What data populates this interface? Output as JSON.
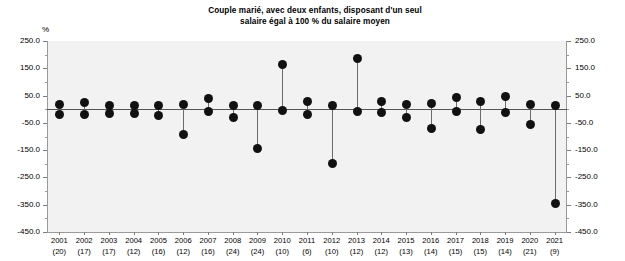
{
  "chart_data": {
    "type": "scatter",
    "title": "Couple marié, avec deux enfants, disposant d'un seul salaire égal à 100 % du salaire moyen",
    "title_line1": "Couple marié, avec deux enfants, disposant d'un seul",
    "title_line2": "salaire égal à 100 % du salaire moyen",
    "xlabel": "",
    "ylabel": "%",
    "unit": "%",
    "ylim": [
      -450.0,
      250.0
    ],
    "ytick_labels": [
      "250.0",
      "150.0",
      "50.0",
      "-50.0",
      "-150.0",
      "-250.0",
      "-350.0",
      "-450.0"
    ],
    "ytick_values": [
      250.0,
      150.0,
      50.0,
      -50.0,
      -150.0,
      -250.0,
      -350.0,
      -450.0
    ],
    "grid": false,
    "legend": "none",
    "dual_axis": true,
    "categories": [
      "2001",
      "2002",
      "2003",
      "2004",
      "2005",
      "2006",
      "2007",
      "2008",
      "2009",
      "2010",
      "2011",
      "2012",
      "2013",
      "2014",
      "2015",
      "2016",
      "2017",
      "2018",
      "2019",
      "2020",
      "2021"
    ],
    "category_counts": [
      20,
      17,
      17,
      12,
      16,
      12,
      16,
      24,
      24,
      10,
      6,
      10,
      12,
      12,
      13,
      14,
      15,
      15,
      14,
      21,
      9
    ],
    "category_labels": [
      "2001 (20)",
      "2002 (17)",
      "2003 (17)",
      "2004 (12)",
      "2005 (16)",
      "2006 (12)",
      "2007 (16)",
      "2008 (24)",
      "2009 (24)",
      "2010 (10)",
      "2011 (6)",
      "2012 (10)",
      "2013 (12)",
      "2014 (12)",
      "2015 (13)",
      "2016 (14)",
      "2017 (15)",
      "2018 (15)",
      "2019 (14)",
      "2020 (21)",
      "2021 (9)"
    ],
    "series": [
      {
        "name": "Maximum",
        "values": [
          18,
          26,
          12,
          14,
          12,
          16,
          40,
          14,
          14,
          165,
          30,
          12,
          187,
          30,
          16,
          20,
          42,
          28,
          46,
          16,
          14
        ]
      },
      {
        "name": "Minimum",
        "values": [
          -18,
          -20,
          -14,
          -16,
          -22,
          -92,
          -8,
          -30,
          -143,
          -4,
          -18,
          -198,
          -8,
          -12,
          -30,
          -72,
          -8,
          -74,
          -12,
          -56,
          -345
        ]
      }
    ]
  }
}
